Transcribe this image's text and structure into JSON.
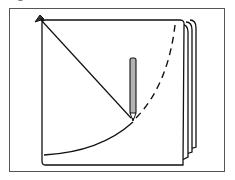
{
  "figure": {
    "caption_fragment": "g",
    "elements": {
      "pin": "pin-icon",
      "pencil": "pencil-icon",
      "string": "string",
      "arc_solid": "drawn arc",
      "arc_dashed": "planned arc"
    },
    "colors": {
      "stroke": "#111111",
      "pencil_fill": "#b3b3b3",
      "page_fill": "#ffffff",
      "frame": "#555555"
    }
  }
}
